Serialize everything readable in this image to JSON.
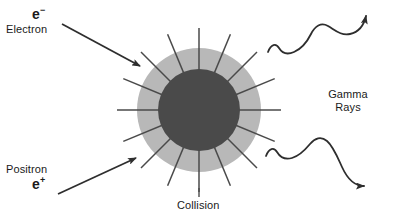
{
  "diagram": {
    "background_color": "#ffffff",
    "stroke_color": "#3a3a3a",
    "text_color": "#1a1a1a",
    "burst": {
      "core_color": "#4a4a4a",
      "halo_color": "#b8b8b8",
      "center_x": 199,
      "center_y": 110,
      "core_radius": 41,
      "halo_radius": 62,
      "spike_count": 16,
      "spike_inner_radius": 28,
      "spike_outer_radius": 82
    },
    "labels": {
      "electron_symbol": "e",
      "electron_charge": "−",
      "electron_name": "Electron",
      "positron_name": "Positron",
      "positron_symbol": "e",
      "positron_charge": "+",
      "gamma_line1": "Gamma",
      "gamma_line2": "Rays",
      "collision": "Collision"
    },
    "arrows": {
      "electron_incoming": {
        "from_x": 62,
        "from_y": 24,
        "to_x": 140,
        "to_y": 66
      },
      "positron_incoming": {
        "from_x": 58,
        "from_y": 194,
        "to_x": 136,
        "to_y": 158
      }
    },
    "waves": {
      "gamma_upper": {
        "start_x": 268,
        "start_y": 52,
        "end_x": 378,
        "end_y": 12,
        "direction": "up-right"
      },
      "gamma_lower": {
        "start_x": 266,
        "start_y": 156,
        "end_x": 380,
        "end_y": 196,
        "direction": "down-right"
      }
    },
    "leader_line": {
      "x": 199,
      "y_top": 188,
      "y_bottom": 197
    }
  }
}
